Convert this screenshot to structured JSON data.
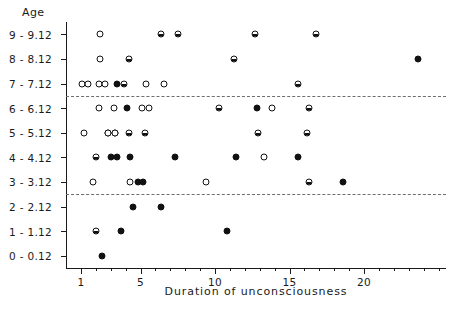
{
  "chart_data": {
    "type": "scatter",
    "title": "",
    "xlabel": "Duration of unconsciousness",
    "ylabel": "Age",
    "xlim": [
      0,
      25.5
    ],
    "ylim": [
      -0.5,
      9.5
    ],
    "grid": false,
    "legend_position": "none",
    "x_ticks_major": [
      1,
      5,
      10,
      15,
      20
    ],
    "x_tick_labels": [
      "1",
      "5",
      "10",
      "15",
      "20"
    ],
    "x_ticks_minor": [
      2,
      3,
      4,
      6,
      7,
      8,
      9,
      11,
      12,
      13,
      14,
      16,
      17,
      18,
      19,
      21,
      22,
      23,
      24,
      25
    ],
    "categories": [
      "0 - 0.12",
      "1 - 1.12",
      "2 - 2.12",
      "3 - 3.12",
      "4 - 4.12",
      "5 - 5.12",
      "6 - 6.12",
      "7 - 7.12",
      "8 - 8.12",
      "9 - 9.12"
    ],
    "marker_styles": [
      "open",
      "half",
      "filled"
    ],
    "reference_lines": [
      {
        "y_category": "2 - 2.12",
        "offset": 0.5,
        "style": "dashed"
      },
      {
        "y_category": "6 - 6.12",
        "offset": 0.5,
        "style": "dashed"
      }
    ],
    "points": [
      {
        "x": 2.4,
        "y": "0 - 0.12",
        "marker": "filled"
      },
      {
        "x": 2.0,
        "y": "1 - 1.12",
        "marker": "half"
      },
      {
        "x": 3.7,
        "y": "1 - 1.12",
        "marker": "filled"
      },
      {
        "x": 10.8,
        "y": "1 - 1.12",
        "marker": "filled"
      },
      {
        "x": 4.5,
        "y": "2 - 2.12",
        "marker": "filled"
      },
      {
        "x": 6.4,
        "y": "2 - 2.12",
        "marker": "filled"
      },
      {
        "x": 1.8,
        "y": "3 - 3.12",
        "marker": "open"
      },
      {
        "x": 4.3,
        "y": "3 - 3.12",
        "marker": "open"
      },
      {
        "x": 4.8,
        "y": "3 - 3.12",
        "marker": "filled"
      },
      {
        "x": 5.2,
        "y": "3 - 3.12",
        "marker": "filled"
      },
      {
        "x": 9.4,
        "y": "3 - 3.12",
        "marker": "open"
      },
      {
        "x": 16.3,
        "y": "3 - 3.12",
        "marker": "half"
      },
      {
        "x": 18.6,
        "y": "3 - 3.12",
        "marker": "filled"
      },
      {
        "x": 2.0,
        "y": "4 - 4.12",
        "marker": "half"
      },
      {
        "x": 3.0,
        "y": "4 - 4.12",
        "marker": "filled"
      },
      {
        "x": 3.4,
        "y": "4 - 4.12",
        "marker": "filled"
      },
      {
        "x": 4.3,
        "y": "4 - 4.12",
        "marker": "filled"
      },
      {
        "x": 7.3,
        "y": "4 - 4.12",
        "marker": "filled"
      },
      {
        "x": 11.4,
        "y": "4 - 4.12",
        "marker": "filled"
      },
      {
        "x": 13.3,
        "y": "4 - 4.12",
        "marker": "open"
      },
      {
        "x": 15.6,
        "y": "4 - 4.12",
        "marker": "filled"
      },
      {
        "x": 1.2,
        "y": "5 - 5.12",
        "marker": "open"
      },
      {
        "x": 2.8,
        "y": "5 - 5.12",
        "marker": "open"
      },
      {
        "x": 3.3,
        "y": "5 - 5.12",
        "marker": "open"
      },
      {
        "x": 2.8,
        "y": "5 - 5.12",
        "marker": "open"
      },
      {
        "x": 3.3,
        "y": "5 - 5.12",
        "marker": "open"
      },
      {
        "x": 4.2,
        "y": "5 - 5.12",
        "marker": "half"
      },
      {
        "x": 5.3,
        "y": "5 - 5.12",
        "marker": "half"
      },
      {
        "x": 12.9,
        "y": "5 - 5.12",
        "marker": "half"
      },
      {
        "x": 16.2,
        "y": "5 - 5.12",
        "marker": "half"
      },
      {
        "x": 2.2,
        "y": "6 - 6.12",
        "marker": "open"
      },
      {
        "x": 3.2,
        "y": "6 - 6.12",
        "marker": "open"
      },
      {
        "x": 4.1,
        "y": "6 - 6.12",
        "marker": "filled"
      },
      {
        "x": 5.1,
        "y": "6 - 6.12",
        "marker": "open"
      },
      {
        "x": 5.6,
        "y": "6 - 6.12",
        "marker": "open"
      },
      {
        "x": 10.3,
        "y": "6 - 6.12",
        "marker": "half"
      },
      {
        "x": 12.8,
        "y": "6 - 6.12",
        "marker": "filled"
      },
      {
        "x": 13.8,
        "y": "6 - 6.12",
        "marker": "open"
      },
      {
        "x": 16.3,
        "y": "6 - 6.12",
        "marker": "half"
      },
      {
        "x": 1.1,
        "y": "7 - 7.12",
        "marker": "open"
      },
      {
        "x": 1.5,
        "y": "7 - 7.12",
        "marker": "open"
      },
      {
        "x": 2.2,
        "y": "7 - 7.12",
        "marker": "open"
      },
      {
        "x": 2.6,
        "y": "7 - 7.12",
        "marker": "open"
      },
      {
        "x": 3.4,
        "y": "7 - 7.12",
        "marker": "filled"
      },
      {
        "x": 3.9,
        "y": "7 - 7.12",
        "marker": "half"
      },
      {
        "x": 5.4,
        "y": "7 - 7.12",
        "marker": "open"
      },
      {
        "x": 6.6,
        "y": "7 - 7.12",
        "marker": "open"
      },
      {
        "x": 15.6,
        "y": "7 - 7.12",
        "marker": "half"
      },
      {
        "x": 2.3,
        "y": "8 - 8.12",
        "marker": "open"
      },
      {
        "x": 4.2,
        "y": "8 - 8.12",
        "marker": "half"
      },
      {
        "x": 11.3,
        "y": "8 - 8.12",
        "marker": "half"
      },
      {
        "x": 23.6,
        "y": "8 - 8.12",
        "marker": "filled"
      },
      {
        "x": 2.3,
        "y": "9 - 9.12",
        "marker": "open"
      },
      {
        "x": 6.4,
        "y": "9 - 9.12",
        "marker": "half"
      },
      {
        "x": 7.5,
        "y": "9 - 9.12",
        "marker": "half"
      },
      {
        "x": 12.7,
        "y": "9 - 9.12",
        "marker": "half"
      },
      {
        "x": 16.8,
        "y": "9 - 9.12",
        "marker": "half"
      }
    ]
  }
}
